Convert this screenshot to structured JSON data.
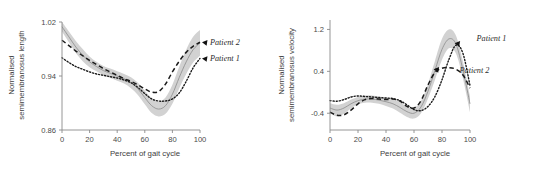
{
  "figure": {
    "panel_count": 2
  },
  "chart_data": [
    {
      "type": "line",
      "panel": "left",
      "title": "",
      "xlabel": "Percent of gait cycle",
      "ylabel": "Normalised semimembranosus length",
      "ylabel_line1": "Normalised",
      "ylabel_line2": "semimembranosus length",
      "xlim": [
        0,
        100
      ],
      "ylim": [
        0.86,
        1.02
      ],
      "xticks": [
        0,
        20,
        40,
        60,
        80,
        100
      ],
      "xtick_labels": [
        "0",
        "20",
        "40",
        "60",
        "80",
        "100"
      ],
      "yticks": [
        0.86,
        0.94,
        1.02
      ],
      "ytick_labels": [
        "0.86",
        "0.94",
        "1.02"
      ],
      "grid": false,
      "legend_position": "right-inside",
      "x": [
        0,
        5,
        10,
        15,
        20,
        25,
        30,
        35,
        40,
        45,
        50,
        55,
        60,
        65,
        70,
        75,
        80,
        85,
        90,
        95,
        100
      ],
      "series": [
        {
          "name": "Patient 2",
          "style": "dashed",
          "values": [
            0.993,
            0.985,
            0.977,
            0.97,
            0.963,
            0.957,
            0.951,
            0.946,
            0.941,
            0.936,
            0.932,
            0.927,
            0.921,
            0.916,
            0.917,
            0.928,
            0.946,
            0.962,
            0.975,
            0.984,
            0.99
          ]
        },
        {
          "name": "Patient 1",
          "style": "dotted",
          "values": [
            0.967,
            0.96,
            0.954,
            0.95,
            0.946,
            0.943,
            0.941,
            0.939,
            0.937,
            0.934,
            0.93,
            0.923,
            0.914,
            0.906,
            0.903,
            0.903,
            0.906,
            0.915,
            0.932,
            0.952,
            0.966
          ]
        },
        {
          "name": "Control mean",
          "style": "thin-solid-band",
          "values": [
            1.013,
            0.998,
            0.983,
            0.971,
            0.961,
            0.954,
            0.948,
            0.944,
            0.94,
            0.936,
            0.93,
            0.921,
            0.908,
            0.896,
            0.891,
            0.896,
            0.913,
            0.938,
            0.961,
            0.979,
            0.989
          ],
          "band_upper": [
            1.02,
            1.006,
            0.992,
            0.98,
            0.969,
            0.961,
            0.955,
            0.951,
            0.947,
            0.943,
            0.938,
            0.93,
            0.918,
            0.907,
            0.902,
            0.908,
            0.927,
            0.954,
            0.979,
            0.998,
            1.008
          ],
          "band_lower": [
            1.006,
            0.99,
            0.974,
            0.962,
            0.953,
            0.947,
            0.941,
            0.937,
            0.933,
            0.929,
            0.922,
            0.912,
            0.898,
            0.885,
            0.88,
            0.884,
            0.899,
            0.922,
            0.943,
            0.96,
            0.97
          ]
        }
      ],
      "annotations": [
        {
          "label": "Patient 2",
          "marker": "arrow",
          "x": 100,
          "y": 0.99
        },
        {
          "label": "Patient 1",
          "marker": "arrow",
          "x": 100,
          "y": 0.966
        }
      ]
    },
    {
      "type": "line",
      "panel": "right",
      "title": "",
      "xlabel": "Percent of gait cycle",
      "ylabel": "Normalised semimembranosus velocity",
      "ylabel_line1": "Normalised",
      "ylabel_line2": "semimembranosus velocity",
      "xlim": [
        0,
        100
      ],
      "ylim": [
        -0.72,
        1.38
      ],
      "xticks": [
        0,
        20,
        40,
        60,
        80,
        100
      ],
      "xtick_labels": [
        "0",
        "20",
        "40",
        "60",
        "80",
        "100"
      ],
      "yticks": [
        -0.4,
        0.4,
        1.2
      ],
      "ytick_labels": [
        "-0.4",
        "0.4",
        "1.2"
      ],
      "grid": false,
      "legend_position": "right-inside",
      "x": [
        0,
        5,
        10,
        15,
        20,
        25,
        30,
        35,
        40,
        45,
        50,
        55,
        60,
        65,
        70,
        75,
        80,
        85,
        90,
        95,
        100
      ],
      "series": [
        {
          "name": "Patient 1",
          "style": "dotted",
          "values": [
            -0.16,
            -0.17,
            -0.14,
            -0.09,
            -0.07,
            -0.08,
            -0.09,
            -0.1,
            -0.11,
            -0.12,
            -0.16,
            -0.24,
            -0.33,
            -0.35,
            -0.27,
            -0.08,
            0.24,
            0.63,
            0.9,
            0.74,
            0.13
          ]
        },
        {
          "name": "Patient 2",
          "style": "dashed",
          "values": [
            -0.38,
            -0.44,
            -0.43,
            -0.34,
            -0.22,
            -0.14,
            -0.12,
            -0.13,
            -0.14,
            -0.13,
            -0.17,
            -0.27,
            -0.3,
            -0.16,
            0.14,
            0.38,
            0.46,
            0.47,
            0.44,
            0.33,
            0.08
          ]
        },
        {
          "name": "Control mean",
          "style": "thin-solid-band",
          "values": [
            -0.3,
            -0.34,
            -0.3,
            -0.22,
            -0.16,
            -0.13,
            -0.13,
            -0.15,
            -0.18,
            -0.22,
            -0.29,
            -0.37,
            -0.4,
            -0.28,
            0.02,
            0.42,
            0.82,
            1.02,
            0.92,
            0.42,
            -0.22
          ],
          "band_upper": [
            -0.21,
            -0.24,
            -0.21,
            -0.14,
            -0.09,
            -0.06,
            -0.06,
            -0.08,
            -0.1,
            -0.13,
            -0.19,
            -0.27,
            -0.3,
            -0.16,
            0.16,
            0.6,
            1.02,
            1.2,
            1.08,
            0.58,
            -0.08
          ],
          "band_lower": [
            -0.4,
            -0.46,
            -0.41,
            -0.31,
            -0.23,
            -0.2,
            -0.2,
            -0.22,
            -0.26,
            -0.31,
            -0.39,
            -0.47,
            -0.5,
            -0.4,
            -0.12,
            0.24,
            0.62,
            0.84,
            0.74,
            0.26,
            -0.38
          ]
        }
      ],
      "annotations": [
        {
          "label": "Patient 1",
          "marker": "arrow",
          "x": 89,
          "y": 0.9
        },
        {
          "label": "Patient 2",
          "marker": "arrow",
          "x": 74,
          "y": 0.42
        }
      ]
    }
  ]
}
